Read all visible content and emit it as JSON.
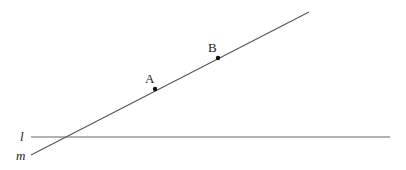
{
  "diagram": {
    "lines": [
      {
        "id": "l",
        "label": "l",
        "x1": 31,
        "y1": 137,
        "x2": 390,
        "y2": 137,
        "color": "#555555"
      },
      {
        "id": "m",
        "label": "m",
        "x1": 31,
        "y1": 155,
        "x2": 309,
        "y2": 12,
        "color": "#555555"
      }
    ],
    "points": [
      {
        "id": "A",
        "label": "A",
        "x": 155,
        "y": 89
      },
      {
        "id": "B",
        "label": "B",
        "x": 218,
        "y": 58
      }
    ],
    "labels": {
      "line_l": "l",
      "line_m": "m",
      "point_a": "A",
      "point_b": "B"
    }
  }
}
